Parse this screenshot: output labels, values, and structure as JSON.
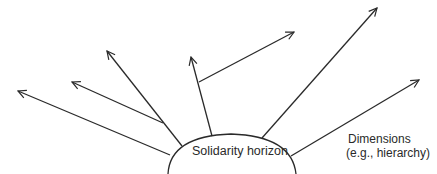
{
  "diagram": {
    "center_label": "Solidarity horizon",
    "dimensions_label_line1": "Dimensions",
    "dimensions_label_line2": "(e.g., hierarchy)",
    "stroke_color": "#2a2a2a",
    "arrows": [
      {
        "from": [
          170,
          155
        ],
        "to": [
          18,
          91
        ]
      },
      {
        "from": [
          163,
          123
        ],
        "to": [
          72,
          82
        ]
      },
      {
        "from": [
          182,
          146
        ],
        "to": [
          107,
          51
        ]
      },
      {
        "from": [
          212,
          136
        ],
        "to": [
          191,
          57
        ]
      },
      {
        "from": [
          199,
          82
        ],
        "to": [
          294,
          32
        ]
      },
      {
        "from": [
          262,
          138
        ],
        "to": [
          377,
          8
        ]
      },
      {
        "from": [
          291,
          156
        ],
        "to": [
          419,
          80
        ]
      }
    ]
  }
}
